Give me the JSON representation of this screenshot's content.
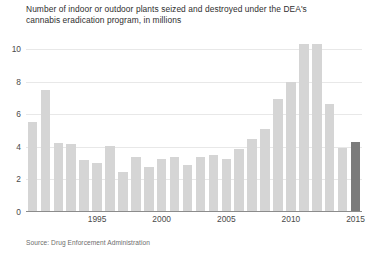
{
  "chart_data": {
    "type": "bar",
    "title": "Number of indoor or outdoor plants seized and destroyed under the DEA's\ncannabis eradication program, in millions",
    "xlabel": "",
    "ylabel": "",
    "ylim": [
      0,
      10.8
    ],
    "yticks": [
      0,
      2,
      4,
      6,
      8,
      10
    ],
    "ytick_labels": [
      "0",
      "2",
      "4",
      "6",
      "8",
      "10"
    ],
    "xticks": [
      1995,
      2000,
      2005,
      2010,
      2015
    ],
    "xtick_labels": [
      "1995",
      "2000",
      "2005",
      "2010",
      "2015"
    ],
    "grid": "horizontal",
    "legend": "none",
    "source": "Source: Drug Enforcement Administration",
    "categories": [
      "1990",
      "1991",
      "1992",
      "1993",
      "1994",
      "1995",
      "1996",
      "1997",
      "1998",
      "1999",
      "2000",
      "2001",
      "2002",
      "2003",
      "2004",
      "2005",
      "2006",
      "2007",
      "2008",
      "2009",
      "2010",
      "2011",
      "2012",
      "2013",
      "2014",
      "2015"
    ],
    "values": [
      5.5,
      7.5,
      4.25,
      4.15,
      3.2,
      3.0,
      4.05,
      2.45,
      3.35,
      2.75,
      3.25,
      3.35,
      2.9,
      3.35,
      3.5,
      3.25,
      3.85,
      4.45,
      5.1,
      6.95,
      7.95,
      10.3,
      10.3,
      6.6,
      3.95,
      4.3
    ],
    "highlight_index": 25,
    "colors": {
      "bar": "#d5d5d5",
      "bar_highlight": "#7b7b7b",
      "gridline": "#e8e8e8",
      "axis": "#8c8c8c",
      "title_text": "#2f2f2f",
      "tick_text": "#4a4a4a",
      "source_text": "#6d6d6d",
      "background": "#ffffff"
    }
  }
}
